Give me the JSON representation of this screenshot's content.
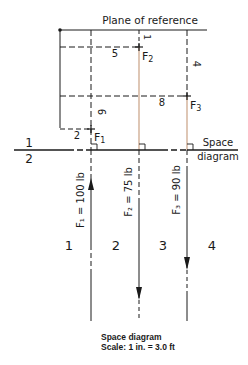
{
  "diagram": {
    "plane_label": "Plane of reference",
    "space_label_line1": "Space",
    "space_label_line2": "diagram",
    "left_space_top": "1",
    "left_space_bottom": "2",
    "forces": [
      {
        "name": "F1",
        "label": "F",
        "sub": "1",
        "value_label": "F₁ = 100 lb",
        "magnitude_lb": 100,
        "direction": "up"
      },
      {
        "name": "F2",
        "label": "F",
        "sub": "2",
        "value_label": "F₂ = 75 lb",
        "magnitude_lb": 75,
        "direction": "down"
      },
      {
        "name": "F3",
        "label": "F",
        "sub": "3",
        "value_label": "F₃ = 90 lb",
        "magnitude_lb": 90,
        "direction": "down"
      }
    ],
    "dimensions": {
      "f1_horizontal": "2",
      "f1_vertical": "6",
      "f2_horizontal": "5",
      "f2_vertical": "1",
      "f3_horizontal": "8",
      "f3_vertical": "4"
    },
    "spaces": [
      "1",
      "2",
      "3",
      "4"
    ],
    "colors": {
      "line": "#1a1a1a",
      "force_line_accent": "#c9a184"
    }
  },
  "caption": {
    "title": "Space diagram",
    "scale": "Scale: 1 in. = 3.0 ft"
  }
}
